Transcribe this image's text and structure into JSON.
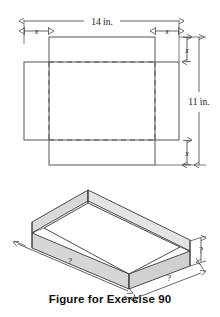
{
  "figure": {
    "caption": "Figure for Exercise 90",
    "flat_pattern": {
      "name": "cardboard-sheet-with-corner-cutouts",
      "width_label": "14 in.",
      "height_label": "11 in.",
      "corner_label_top_left": "x",
      "corner_label_top_right": "x",
      "corner_label_right_top": "x",
      "corner_label_right_bottom": "x",
      "sheet_width_in": 14,
      "sheet_height_in": 11,
      "cut_size_symbol": "x"
    },
    "box": {
      "name": "open-top-box",
      "length_label": "?",
      "width_label": "?",
      "height_label": "?",
      "face_fill": "#d9d9d9",
      "top_fill": "#ffffff",
      "stroke": "#3a3a3a"
    }
  },
  "colors": {
    "line": "#555555",
    "dashed": "#555555",
    "text": "#111111",
    "box_side": "#d9d9d9",
    "box_front": "#d2d2d2",
    "box_inner": "#ffffff",
    "background": "#ffffff"
  }
}
